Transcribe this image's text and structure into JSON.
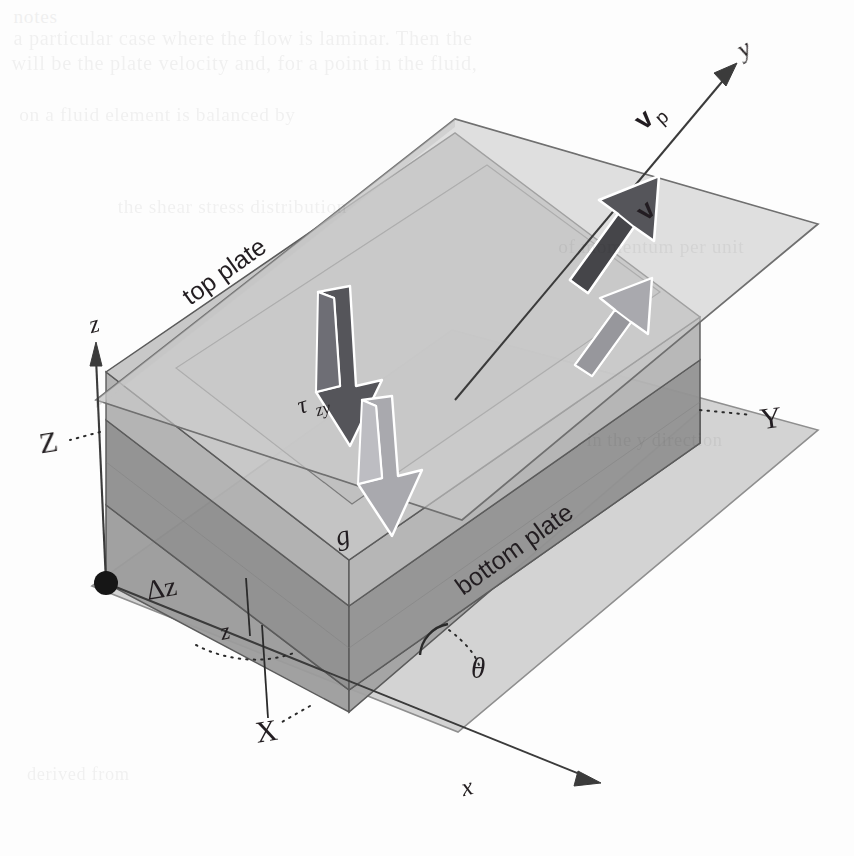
{
  "figure": {
    "background_color": "#fdfdfd",
    "ink_color": "#231f20"
  },
  "labels": {
    "top_plate": "top plate",
    "bottom_plate": "bottom plate",
    "axis_x_lower": "x",
    "axis_y_lower": "y",
    "axis_z_lower": "z",
    "axis_X_upper": "X",
    "axis_Y_upper": "Y",
    "axis_Z_upper": "Z",
    "plate_velocity": "v",
    "plate_velocity_sub": "p",
    "fluid_velocity": "v",
    "shear_stress": "τ",
    "shear_stress_sub": "zy",
    "gravity": "g",
    "layer_thickness": "Δz",
    "layer_coordinate": "z",
    "incline_angle": "θ"
  },
  "colors": {
    "plate_fill": "#c9c9c9",
    "plate_fill_light": "#d5d5d5",
    "slab_top": "#bdbdbd",
    "slab_mid_dark": "#9a9a9a",
    "slab_front": "#a8a8a8",
    "slab_side": "#8f8f8f",
    "edge_stroke": "#5b5b5b",
    "edge_stroke_light": "#8a8a8a",
    "arrow_dark": "#55555a",
    "arrow_light": "#a9a9ae",
    "axis_line": "#3a3a3a",
    "origin_dot": "#151515"
  },
  "ghost_text": {
    "line1": "notes",
    "line2": "a particular case where the flow is laminar. Then the",
    "line3": "will be the plate velocity and, for a point in the fluid,",
    "line4": "on a fluid element is balanced by",
    "line5": "the shear stress distribution",
    "line6": "of momentum per unit",
    "line7": "in the y direction",
    "line8": "derived from"
  },
  "geometry": {
    "origin": [
      106,
      583
    ],
    "axis_z_tip": [
      93,
      345
    ],
    "axis_y_tip": [
      737,
      60
    ],
    "axis_x_tip": [
      600,
      790
    ],
    "angle_theta_deg": 26
  }
}
